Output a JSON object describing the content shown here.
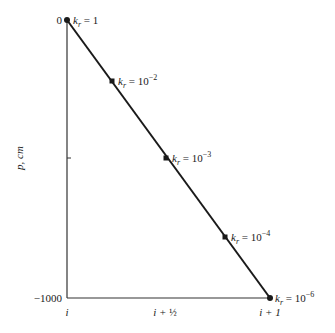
{
  "diagram": {
    "y_axis": {
      "label": "p, cm",
      "top_tick": "0",
      "bottom_tick": "−1000"
    },
    "x_axis": {
      "ticks": [
        {
          "label_main": "i",
          "label_frac": ""
        },
        {
          "label_main": "i + ",
          "label_frac": "½"
        },
        {
          "label_main": "i + 1",
          "label_frac": ""
        }
      ]
    },
    "points": [
      {
        "symbol": "k",
        "sub": "r",
        "eq": " = 1",
        "exp": ""
      },
      {
        "symbol": "k",
        "sub": "r",
        "eq": " = 10",
        "exp": "−2"
      },
      {
        "symbol": "k",
        "sub": "r",
        "eq": " = 10",
        "exp": "−3"
      },
      {
        "symbol": "k",
        "sub": "r",
        "eq": " = 10",
        "exp": "−4"
      },
      {
        "symbol": "k",
        "sub": "r",
        "eq": " = 10",
        "exp": "−6"
      }
    ],
    "colors": {
      "line": "#1a1a1a",
      "background": "#ffffff"
    }
  }
}
